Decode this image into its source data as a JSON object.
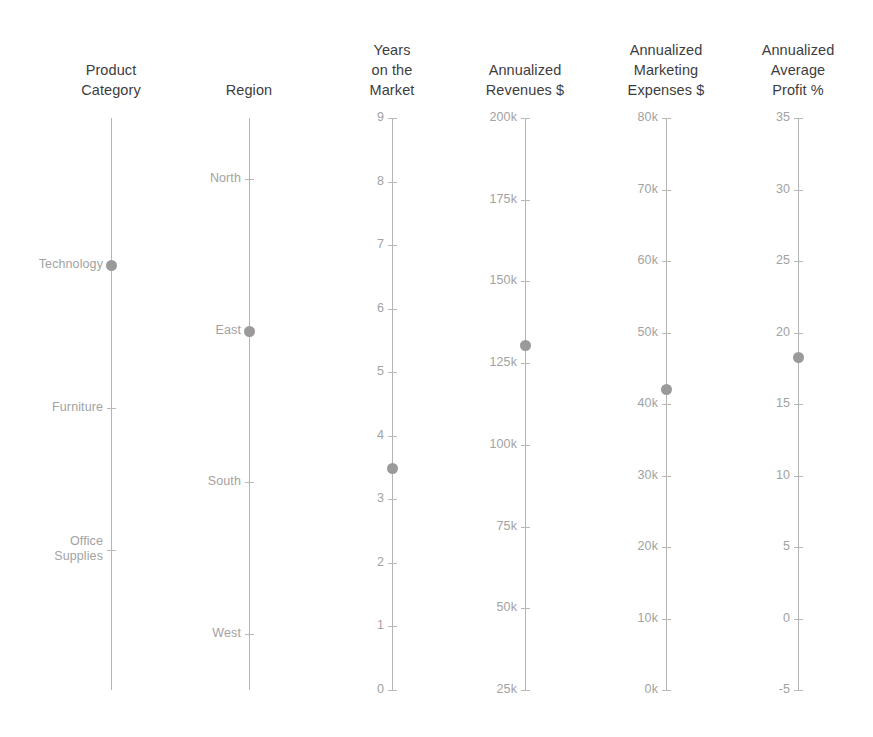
{
  "chart_data": {
    "type": "parallel-coordinates",
    "title": "",
    "grid": false,
    "legend": null,
    "background_color": "#ffffff",
    "axis_color": "#b4b4b4",
    "tick_label_color": "#a2a2a2",
    "title_color": "#3d3d3d",
    "point_color": "#9a9a9a",
    "axis_top_px": 118,
    "axis_bottom_px": 690,
    "axes": [
      {
        "name": "product-category",
        "title": "Product\nCategory",
        "kind": "categorical",
        "x_px": 111,
        "title_x_px": 31,
        "categories": [
          "Technology",
          "Furniture",
          "Office Supplies"
        ],
        "category_y_px": [
          265,
          408,
          550
        ],
        "value": "Technology",
        "point_y_px": 265
      },
      {
        "name": "region",
        "title": "Region",
        "kind": "categorical",
        "x_px": 249,
        "title_x_px": 169,
        "categories": [
          "North",
          "East",
          "South",
          "West"
        ],
        "category_y_px": [
          179,
          331,
          482,
          634
        ],
        "value": "East",
        "point_y_px": 331
      },
      {
        "name": "years-on-the-market",
        "title": "Years\non the\nMarket",
        "kind": "numeric",
        "x_px": 392,
        "title_x_px": 312,
        "ticks": [
          "9",
          "8",
          "7",
          "6",
          "5",
          "4",
          "3",
          "2",
          "1",
          "0"
        ],
        "tick_values": [
          9,
          8,
          7,
          6,
          5,
          4,
          3,
          2,
          1,
          0
        ],
        "ylim": [
          0,
          9
        ],
        "value": 3.5,
        "point_y_px": 468
      },
      {
        "name": "annualized-revenues",
        "title": "Annualized\nRevenues $",
        "kind": "numeric",
        "x_px": 525,
        "title_x_px": 445,
        "ticks": [
          "200k",
          "175k",
          "150k",
          "125k",
          "100k",
          "75k",
          "50k",
          "25k"
        ],
        "tick_values": [
          200000,
          175000,
          150000,
          125000,
          100000,
          75000,
          50000,
          25000
        ],
        "ylim": [
          25000,
          200000
        ],
        "value": 132000,
        "point_y_px": 345
      },
      {
        "name": "annualized-marketing-expenses",
        "title": "Annualized\nMarketing\nExpenses $",
        "kind": "numeric",
        "x_px": 666,
        "title_x_px": 586,
        "ticks": [
          "80k",
          "70k",
          "60k",
          "50k",
          "40k",
          "30k",
          "20k",
          "10k",
          "0k"
        ],
        "tick_values": [
          80000,
          70000,
          60000,
          50000,
          40000,
          30000,
          20000,
          10000,
          0
        ],
        "ylim": [
          0,
          80000
        ],
        "value": 42000,
        "point_y_px": 389
      },
      {
        "name": "annualized-average-profit",
        "title": "Annualized\nAverage\nProfit %",
        "kind": "numeric",
        "x_px": 798,
        "title_x_px": 718,
        "ticks": [
          "35",
          "30",
          "25",
          "20",
          "15",
          "10",
          "5",
          "0",
          "-5"
        ],
        "tick_values": [
          35,
          30,
          25,
          20,
          15,
          10,
          5,
          0,
          -5
        ],
        "ylim": [
          -5,
          35
        ],
        "value": 17.5,
        "point_y_px": 357
      }
    ],
    "record": {
      "product_category": "Technology",
      "region": "East",
      "years_on_the_market": 3.5,
      "annualized_revenues": 132000,
      "annualized_marketing_expenses": 42000,
      "annualized_average_profit": 17.5
    }
  }
}
